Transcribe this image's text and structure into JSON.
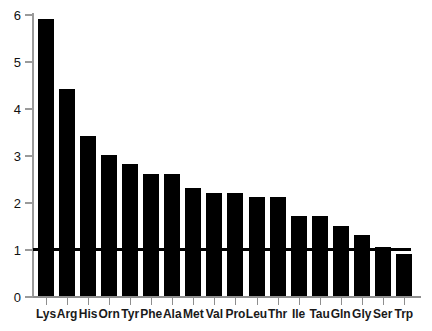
{
  "chart_data": {
    "type": "bar",
    "title": "",
    "xlabel": "",
    "ylabel": "",
    "categories": [
      "Lys",
      "Arg",
      "His",
      "Orn",
      "Tyr",
      "Phe",
      "Ala",
      "Met",
      "Val",
      "Pro",
      "Leu",
      "Thr",
      "Ile",
      "Tau",
      "Gln",
      "Gly",
      "Ser",
      "Trp"
    ],
    "values": [
      5.9,
      4.4,
      3.4,
      3.0,
      2.8,
      2.6,
      2.6,
      2.3,
      2.2,
      2.2,
      2.1,
      2.1,
      1.7,
      1.7,
      1.5,
      1.3,
      1.05,
      0.9
    ],
    "ylim": [
      0,
      6
    ],
    "yticks": [
      0,
      1,
      2,
      3,
      4,
      5,
      6
    ],
    "ytick_labels": [
      "0",
      "1",
      "2",
      "3",
      "4",
      "5",
      "6"
    ],
    "grid": false,
    "legend": null,
    "annotations": [
      {
        "name": "reference-line",
        "type": "hline",
        "value": 1,
        "label": ""
      }
    ],
    "bar_color": "#000000",
    "axis_color": "#8e8e8e"
  }
}
